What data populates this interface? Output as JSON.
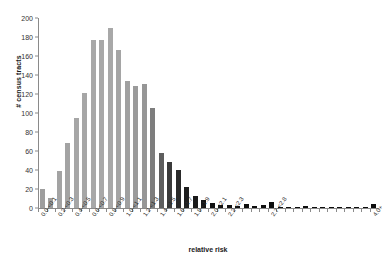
{
  "chart_data": {
    "type": "bar",
    "title": "",
    "xlabel": "relative risk",
    "ylabel": "# census tracts",
    "ylim": [
      0,
      200
    ],
    "yticks": [
      0,
      20,
      40,
      60,
      80,
      100,
      120,
      140,
      160,
      180,
      200
    ],
    "grid": false,
    "legend": null,
    "categories": [
      "0.0-<0.1",
      "0.1-<0.2",
      "0.2-<0.3",
      "0.3-<0.4",
      "0.4-<0.5",
      "0.5-<0.6",
      "0.6-<0.7",
      "0.7-<0.8",
      "0.8-<0.9",
      "0.9-<1.0",
      "1.0-<1.1",
      "1.1-<1.2",
      "1.2-<1.3",
      "1.3-<1.4",
      "1.4-<1.5",
      "1.5-<1.6",
      "1.6-<1.7",
      "1.7-<1.8",
      "1.8-<1.9",
      "1.9-<2.0",
      "2.0-<2.1",
      "2.1-<2.2",
      "2.2-<2.3",
      "2.3-<2.4",
      "2.4-<2.5",
      "2.5-<2.6",
      "2.6-<2.7",
      "2.7-<2.8",
      "2.8-<2.9",
      "2.9-<3.0",
      "3.0-<3.1",
      "3.1-<3.2",
      "3.2-<3.3",
      "3.3-<3.4",
      "3.4-<3.5",
      "3.5-<3.6",
      "3.6-<3.7",
      "3.7-<3.8",
      "3.8-<3.9",
      "4.0+"
    ],
    "tick_labels": [
      "0.0-<0.1",
      "",
      "0.2-<0.3",
      "",
      "0.4-<0.5",
      "",
      "0.6-<0.7",
      "",
      "0.8-<0.9",
      "",
      "1.0-<1.1",
      "",
      "1.2-<1.3",
      "",
      "1.4-<1.5",
      "",
      "1.6-<1.7",
      "",
      "1.8-<1.9",
      "",
      "2.0-<2.1",
      "",
      "2.2-<2.3",
      "",
      "",
      "",
      "",
      "2.7-<2.8",
      "",
      "",
      "",
      "",
      "",
      "",
      "",
      "",
      "",
      "",
      "",
      "4.0+"
    ],
    "values": [
      20,
      11,
      39,
      68,
      95,
      121,
      177,
      177,
      189,
      166,
      134,
      128,
      131,
      105,
      58,
      48,
      40,
      22,
      13,
      8,
      5,
      3,
      3,
      2,
      4,
      2,
      3,
      6,
      1,
      1,
      1,
      2,
      1,
      1,
      1,
      1,
      1,
      1,
      1,
      4
    ],
    "bar_colors": [
      "#9e9e9e",
      "#9e9e9e",
      "#a3a3a3",
      "#a3a3a3",
      "#a6a6a6",
      "#a6a6a6",
      "#a8a8a8",
      "#a8a8a8",
      "#a8a8a8",
      "#a5a5a5",
      "#a0a0a0",
      "#9b9b9b",
      "#969696",
      "#7d7d7d",
      "#5e5e5e",
      "#3a3a3a",
      "#2a2a2a",
      "#1e1e1e",
      "#1a1a1a",
      "#141414",
      "#101010",
      "#101010",
      "#101010",
      "#101010",
      "#0d0d0d",
      "#0d0d0d",
      "#0d0d0d",
      "#0d0d0d",
      "#0d0d0d",
      "#0d0d0d",
      "#0d0d0d",
      "#0d0d0d",
      "#0d0d0d",
      "#0d0d0d",
      "#0d0d0d",
      "#0d0d0d",
      "#0d0d0d",
      "#0d0d0d",
      "#0d0d0d",
      "#0d0d0d"
    ],
    "axis_color": "#8a8a8a",
    "text_color": "#1a1a1a",
    "background": "#ffffff"
  }
}
